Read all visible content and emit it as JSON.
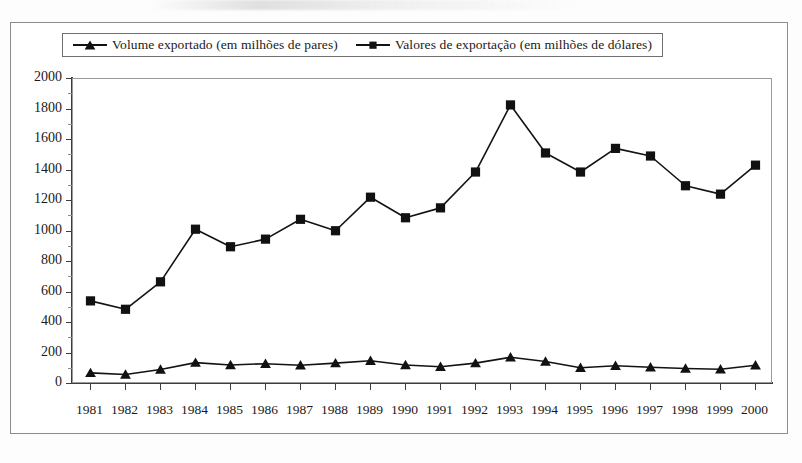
{
  "chart_data": {
    "type": "line",
    "title": "",
    "subtitle": "",
    "xlabel": "",
    "ylabel": "",
    "grid": false,
    "legend_position": "top",
    "ylim": [
      0,
      2000
    ],
    "ytick_step": 200,
    "yticks": [
      "0",
      "200",
      "400",
      "600",
      "800",
      "1000",
      "1200",
      "1400",
      "1600",
      "1800",
      "2000"
    ],
    "categories": [
      "1981",
      "1982",
      "1983",
      "1984",
      "1985",
      "1986",
      "1987",
      "1988",
      "1989",
      "1990",
      "1991",
      "1992",
      "1993",
      "1994",
      "1995",
      "1996",
      "1997",
      "1998",
      "1999",
      "2000"
    ],
    "series": [
      {
        "name": "Volume exportado (em milhões de pares)",
        "marker": "triangle",
        "color": "#111111",
        "values": [
          73,
          62,
          95,
          140,
          125,
          133,
          123,
          137,
          152,
          125,
          113,
          137,
          175,
          148,
          107,
          120,
          110,
          102,
          97,
          123
        ]
      },
      {
        "name": "Valores de exportação (em milhões de dólares)",
        "marker": "square",
        "color": "#111111",
        "values": [
          545,
          490,
          670,
          1015,
          900,
          950,
          1080,
          1005,
          1225,
          1090,
          1155,
          1390,
          1830,
          1515,
          1390,
          1545,
          1495,
          1300,
          1245,
          1435
        ]
      }
    ]
  },
  "legend": {
    "entries": [
      {
        "label": "Volume exportado (em milhões de pares)",
        "marker": "triangle-marker"
      },
      {
        "label": "Valores de exportação (em milhões de dólares)",
        "marker": "square-marker"
      }
    ]
  },
  "colors": {
    "series": "#111111",
    "axis": "#3d3d3d",
    "frame": "#8c8c8c",
    "background": "#ffffff"
  }
}
